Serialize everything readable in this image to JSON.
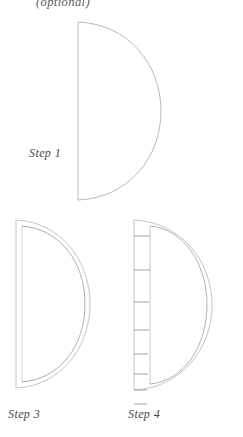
{
  "page": {
    "background_color": "#ffffff",
    "width": 243,
    "height": 437
  },
  "style": {
    "line_color": "#b3b3b3",
    "line_color_faint": "#cfcfcf",
    "line_color_dark": "#9a9a9a",
    "caption_color": "#4a4a4a"
  },
  "notes": {
    "optional": "(optional)"
  },
  "steps": [
    {
      "id": "step1",
      "caption": "Step 1",
      "shape": "half-circle",
      "description": "Single outline half circle, flat edge on the left, curved edge bulging to the right",
      "features": [
        "outer-cut-line"
      ]
    },
    {
      "id": "step3",
      "caption": "Step 3",
      "shape": "half-circle",
      "description": "Half circle drawn with a double outline showing seam allowance inside the cut line",
      "features": [
        "outer-cut-line",
        "inner-stitch-line",
        "left-edge-double-line"
      ]
    },
    {
      "id": "step4",
      "caption": "Step 4",
      "shape": "half-circle",
      "description": "Half circle with double outline and horizontal notch tick marks along the straight left edge, spaced closer together toward the bottom",
      "features": [
        "outer-cut-line",
        "inner-stitch-line",
        "left-edge-double-line",
        "notch-ticks"
      ],
      "notch_ticks": [
        {
          "y": 10,
          "length": 16
        },
        {
          "y": 44,
          "length": 16
        },
        {
          "y": 76,
          "length": 15
        },
        {
          "y": 104,
          "length": 15
        },
        {
          "y": 128,
          "length": 14
        },
        {
          "y": 148,
          "length": 14
        },
        {
          "y": 164,
          "length": 13
        },
        {
          "y": 178,
          "length": 13
        }
      ]
    }
  ]
}
